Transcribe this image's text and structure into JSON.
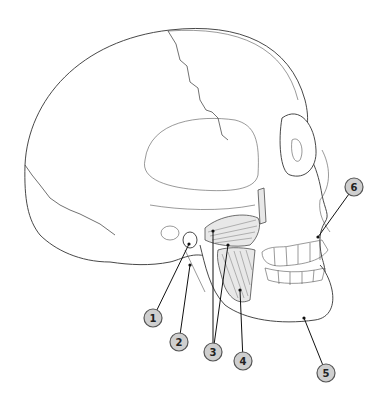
{
  "diagram": {
    "labels": [
      {
        "id": "label-1",
        "text": "1",
        "cx": 153,
        "cy": 318,
        "target": [
          189,
          244
        ]
      },
      {
        "id": "label-2",
        "text": "2",
        "cx": 179,
        "cy": 342,
        "target": [
          190,
          265
        ]
      },
      {
        "id": "label-3",
        "text": "3",
        "cx": 213,
        "cy": 352,
        "targets": [
          [
            213,
            231
          ],
          [
            228,
            245
          ]
        ]
      },
      {
        "id": "label-4",
        "text": "4",
        "cx": 243,
        "cy": 361,
        "target": [
          240,
          290
        ]
      },
      {
        "id": "label-5",
        "text": "5",
        "cx": 326,
        "cy": 373,
        "target": [
          304,
          318
        ]
      },
      {
        "id": "label-6",
        "text": "6",
        "cx": 354,
        "cy": 187,
        "target": [
          318,
          237
        ]
      }
    ],
    "colors": {
      "label_fill": "#cfcfcf",
      "label_stroke": "#555555",
      "line": "#111111",
      "background": "#ffffff"
    }
  }
}
